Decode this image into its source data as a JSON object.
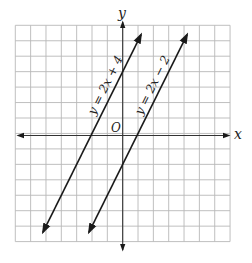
{
  "chart_data": {
    "type": "line",
    "title": "",
    "xlabel": "x",
    "ylabel": "y",
    "origin_label": "O",
    "xlim": [
      -7,
      7
    ],
    "ylim": [
      -7,
      7
    ],
    "grid": true,
    "grid_cells": {
      "x": 14,
      "y": 14
    },
    "tick_labels": [],
    "series": [
      {
        "name": "y = 2x + 4",
        "slope": 2,
        "intercept": 4,
        "x": [
          -5.2,
          1.2
        ],
        "y": [
          -6.4,
          6.4
        ],
        "arrows_both_ends": true
      },
      {
        "name": "y = 2x − 2",
        "slope": 2,
        "intercept": -2,
        "x": [
          -2.2,
          4.2
        ],
        "y": [
          -6.4,
          6.4
        ],
        "arrows_both_ends": true
      }
    ],
    "legend": "none (labels placed along lines)"
  },
  "labels": {
    "x_axis": "x",
    "y_axis": "y",
    "origin": "O",
    "line1": "y = 2x + 4",
    "line2": "y = 2x − 2"
  },
  "colors": {
    "grid": "#b8b8b8",
    "axes": "#333333",
    "lines": "#1a1a1a",
    "background": "#ffffff"
  }
}
